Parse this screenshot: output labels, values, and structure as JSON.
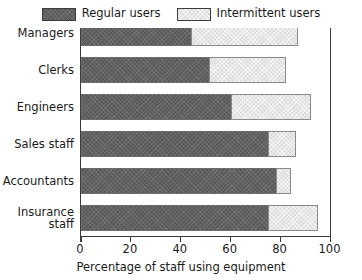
{
  "chart_data": {
    "type": "bar",
    "orientation": "horizontal",
    "stacked": true,
    "title": "",
    "xlabel": "Percentage of staff using equipment",
    "ylabel": "",
    "xlim": [
      0,
      100
    ],
    "xticks": [
      0,
      20,
      40,
      60,
      80,
      100
    ],
    "grid": false,
    "legend_position": "top-center",
    "categories": [
      "Managers",
      "Clerks",
      "Engineers",
      "Sales staff",
      "Accountants",
      "Insurance staff"
    ],
    "category_lines": [
      [
        "Managers"
      ],
      [
        "Clerks"
      ],
      [
        "Engineers"
      ],
      [
        "Sales staff"
      ],
      [
        "Accountants"
      ],
      [
        "Insurance",
        "staff"
      ]
    ],
    "series": [
      {
        "name": "Regular users",
        "color": "#595959",
        "values": [
          44,
          51.5,
          60,
          75,
          78,
          75
        ]
      },
      {
        "name": "Intermittent users",
        "color": "#dcdcdc",
        "values": [
          43,
          30.5,
          32,
          11,
          6,
          20
        ]
      }
    ],
    "totals": [
      87,
      82,
      92,
      86,
      84,
      95
    ]
  },
  "legend": {
    "items": [
      {
        "label": "Regular users",
        "swatch": "regular-users-swatch"
      },
      {
        "label": "Intermittent users",
        "swatch": "intermittent-users-swatch"
      }
    ]
  },
  "axis": {
    "x_title": "Percentage of staff using equipment",
    "x_ticklabels": [
      "0",
      "20",
      "40",
      "60",
      "80",
      "100"
    ]
  },
  "colors": {
    "regular": "#595959",
    "intermittent": "#dcdcdc",
    "frame": "#3c3c3c",
    "text": "#1a1a1a",
    "background": "#ffffff"
  }
}
